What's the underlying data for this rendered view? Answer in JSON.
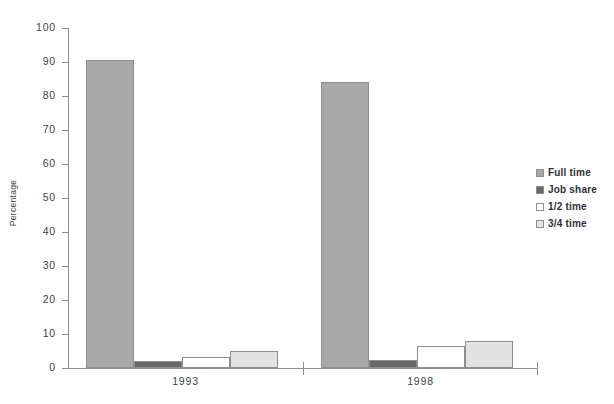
{
  "chart_data": {
    "type": "bar",
    "title": "",
    "xlabel": "",
    "ylabel": "Percentage",
    "ylim": [
      0,
      100
    ],
    "ytick_step": 10,
    "yticks": [
      "100",
      "90",
      "80",
      "70",
      "60",
      "50",
      "40",
      "30",
      "20",
      "10",
      "0"
    ],
    "categories": [
      "1993",
      "1998"
    ],
    "grid": false,
    "legend_position": "right",
    "series": [
      {
        "name": "Full time",
        "values": [
          90.5,
          84.0
        ],
        "color": "#a8a8a8"
      },
      {
        "name": "Job share",
        "values": [
          2.0,
          2.3
        ],
        "color": "#686868"
      },
      {
        "name": "1/2 time",
        "values": [
          3.2,
          6.5
        ],
        "color": "#ffffff"
      },
      {
        "name": "3/4 time",
        "values": [
          5.0,
          8.0
        ],
        "color": "#e2e2e2"
      }
    ]
  },
  "axis": {
    "y_caption": "Percentage"
  },
  "legend": {
    "items": [
      {
        "label": "Full time"
      },
      {
        "label": "Job share"
      },
      {
        "label": "1/2 time"
      },
      {
        "label": "3/4 time"
      }
    ]
  },
  "colors": {
    "full_time": "#a8a8a8",
    "job_share": "#686868",
    "half_time": "#ffffff",
    "three_quarter_time": "#e2e2e2",
    "axis": "#8d8d8d",
    "text": "#3f3f48"
  }
}
